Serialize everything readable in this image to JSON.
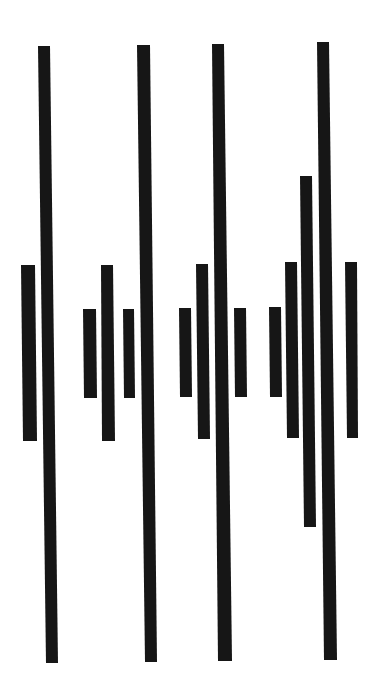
{
  "figure": {
    "width": 376,
    "height": 693,
    "background": "#ffffff",
    "bar_color": "#161616",
    "groups": [
      {
        "name": "group-1",
        "bars": [
          {
            "x1": 21,
            "x2": 35,
            "top": 265,
            "bottom": 441,
            "x1b": 23,
            "x2b": 37
          },
          {
            "x1": 38,
            "x2": 50,
            "top": 46,
            "bottom": 663,
            "x1b": 46,
            "x2b": 58
          }
        ]
      },
      {
        "name": "group-2",
        "bars": [
          {
            "x1": 83,
            "x2": 96,
            "top": 309,
            "bottom": 398,
            "x1b": 84,
            "x2b": 97
          },
          {
            "x1": 101,
            "x2": 113,
            "top": 265,
            "bottom": 441,
            "x1b": 102,
            "x2b": 115
          },
          {
            "x1": 123,
            "x2": 134,
            "top": 309,
            "bottom": 398,
            "x1b": 124,
            "x2b": 135
          },
          {
            "x1": 137,
            "x2": 150,
            "top": 45,
            "bottom": 662,
            "x1b": 145,
            "x2b": 157
          }
        ]
      },
      {
        "name": "group-3",
        "bars": [
          {
            "x1": 179,
            "x2": 191,
            "top": 308,
            "bottom": 397,
            "x1b": 180,
            "x2b": 192
          },
          {
            "x1": 196,
            "x2": 208,
            "top": 264,
            "bottom": 439,
            "x1b": 198,
            "x2b": 210
          },
          {
            "x1": 212,
            "x2": 224,
            "top": 44,
            "bottom": 661,
            "x1b": 218,
            "x2b": 232
          },
          {
            "x1": 234,
            "x2": 246,
            "top": 308,
            "bottom": 397,
            "x1b": 235,
            "x2b": 247
          }
        ]
      },
      {
        "name": "group-4",
        "bars": [
          {
            "x1": 269,
            "x2": 281,
            "top": 307,
            "bottom": 397,
            "x1b": 270,
            "x2b": 282
          },
          {
            "x1": 285,
            "x2": 297,
            "top": 262,
            "bottom": 438,
            "x1b": 287,
            "x2b": 299
          },
          {
            "x1": 300,
            "x2": 312,
            "top": 176,
            "bottom": 527,
            "x1b": 304,
            "x2b": 316
          },
          {
            "x1": 317,
            "x2": 329,
            "top": 42,
            "bottom": 660,
            "x1b": 324,
            "x2b": 337
          },
          {
            "x1": 345,
            "x2": 357,
            "top": 262,
            "bottom": 438,
            "x1b": 347,
            "x2b": 358
          }
        ]
      }
    ]
  }
}
